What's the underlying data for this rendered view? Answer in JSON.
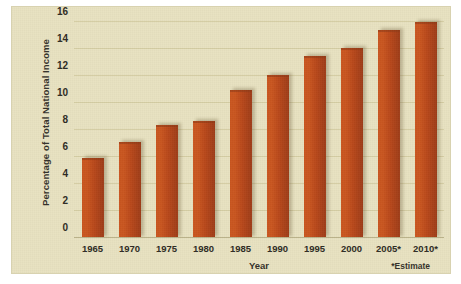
{
  "chart_data": {
    "type": "bar",
    "title": "",
    "xlabel": "Year",
    "ylabel": "Percentage of Total National Income",
    "categories": [
      "1965",
      "1970",
      "1975",
      "1980",
      "1985",
      "1990",
      "1995",
      "2000",
      "2005*",
      "2010*"
    ],
    "values": [
      5.9,
      7.1,
      8.4,
      8.7,
      11.0,
      12.1,
      13.5,
      14.1,
      15.4,
      16.0
    ],
    "ylim": [
      0,
      16
    ],
    "yticks": [
      "0",
      "2",
      "4",
      "6",
      "8",
      "10",
      "12",
      "14",
      "16"
    ],
    "ytick_values": [
      0,
      2,
      4,
      6,
      8,
      10,
      12,
      14,
      16
    ],
    "grid": true,
    "legend": false,
    "annotations": [
      "*Estimate"
    ],
    "footnote": "*Estimate",
    "bar_color": "#c0501c",
    "background_color": "#e8e2c0",
    "gridline_color": "#d5cda4"
  }
}
